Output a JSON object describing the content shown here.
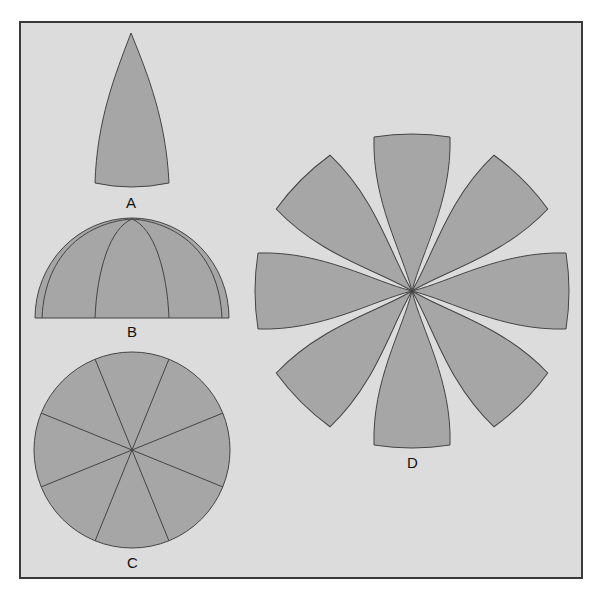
{
  "figure": {
    "background_color": "#dcdcdc",
    "frame_color": "#3a3a3a",
    "fill_color": "#a6a6a6",
    "stroke_color": "#444444",
    "panels": [
      {
        "id": "A",
        "label": "A",
        "description": "single gore (lune) segment"
      },
      {
        "id": "B",
        "label": "B",
        "description": "hemisphere side view with gore seams"
      },
      {
        "id": "C",
        "label": "C",
        "description": "circle divided into 8 sectors"
      },
      {
        "id": "D",
        "label": "D",
        "description": "8 gores arranged radially around a center point"
      }
    ],
    "gore_count": 8
  }
}
